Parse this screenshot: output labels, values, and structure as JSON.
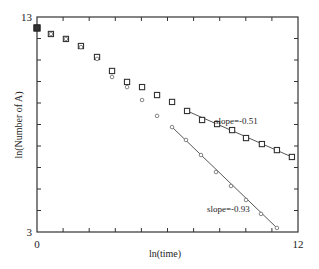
{
  "chart_data": {
    "type": "scatter",
    "title": "",
    "xlabel": "ln(time)",
    "ylabel": "ln(Number of A)",
    "xlim": [
      0,
      12
    ],
    "ylim": [
      3,
      13
    ],
    "x_tick_labels": [
      "0",
      "12"
    ],
    "y_tick_labels": [
      "3",
      "13"
    ],
    "x_minor_ticks": 10,
    "y_minor_ticks": 10,
    "grid": false,
    "legend": null,
    "series": [
      {
        "name": "squares",
        "marker": "square",
        "x": [
          0.0,
          0.64,
          1.33,
          2.02,
          2.76,
          3.45,
          4.14,
          4.83,
          5.52,
          6.21,
          6.9,
          7.59,
          8.28,
          8.97,
          9.61,
          10.34,
          11.03,
          11.72
        ],
        "y": [
          12.49,
          12.21,
          11.98,
          11.65,
          11.14,
          10.49,
          9.98,
          9.74,
          9.37,
          9.05,
          8.63,
          8.21,
          8.02,
          7.74,
          7.37,
          7.09,
          6.81,
          6.49
        ],
        "fit_line": {
          "x_start": 6.9,
          "x_end": 11.72,
          "slope": -0.51
        },
        "annotation": "slope=-0.51"
      },
      {
        "name": "circles",
        "marker": "circle",
        "x": [
          0.0,
          0.64,
          1.33,
          2.02,
          2.76,
          3.45,
          4.14,
          4.83,
          5.52,
          6.21,
          6.85,
          7.54,
          8.23,
          8.92,
          9.61,
          10.3,
          11.03
        ],
        "y": [
          12.49,
          12.21,
          11.98,
          11.6,
          11.05,
          10.21,
          9.74,
          9.14,
          8.4,
          7.88,
          7.28,
          6.58,
          5.79,
          5.14,
          4.49,
          3.84,
          3.19
        ],
        "fit_line": {
          "x_start": 6.21,
          "x_end": 11.03,
          "slope": -0.93
        },
        "annotation": "slope=-0.93"
      }
    ],
    "annotations": [
      {
        "text": "slope=-0.51",
        "x": 9.6,
        "y": 7.9
      },
      {
        "text": "slope=-0.93",
        "x": 7.3,
        "y": 3.8
      }
    ]
  },
  "labels": {
    "xlabel": "ln(time)",
    "ylabel": "ln(Number of A)",
    "x_min": "0",
    "x_max": "12",
    "y_min": "3",
    "y_max": "13",
    "annot_upper": "slope=-0.51",
    "annot_lower": "slope=-0.93"
  }
}
